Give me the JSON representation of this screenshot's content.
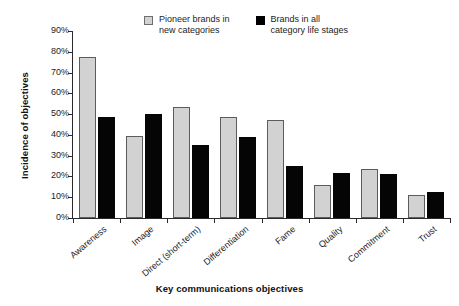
{
  "chart_data": {
    "type": "bar",
    "title": "",
    "xlabel": "Key communications objectives",
    "ylabel": "Incidence of objectives",
    "ylim": [
      0,
      90
    ],
    "ytick_labels": [
      "0%",
      "10%",
      "20%",
      "30%",
      "40%",
      "50%",
      "60%",
      "70%",
      "80%",
      "90%"
    ],
    "ytick_values": [
      0,
      10,
      20,
      30,
      40,
      50,
      60,
      70,
      80,
      90
    ],
    "grid": false,
    "legend_position": "top-center",
    "categories": [
      "Awareness",
      "Image",
      "Direct (short-term)",
      "Differentiation",
      "Fame",
      "Quality",
      "Commitment",
      "Trust"
    ],
    "series": [
      {
        "name": "Pioneer brands in\nnew categories",
        "color": "#d2d2d2",
        "values": [
          77.5,
          39.5,
          53.5,
          48.5,
          47,
          16,
          23.5,
          11
        ]
      },
      {
        "name": "Brands in all\ncategory life stages",
        "color": "#000000",
        "values": [
          48.5,
          50,
          35,
          39,
          25,
          21.5,
          21,
          12.5
        ]
      }
    ]
  },
  "legend": {
    "entries": [
      {
        "label": "Pioneer brands in\nnew categories",
        "swatch": "gray-square-swatch"
      },
      {
        "label": "Brands in all\ncategory life stages",
        "swatch": "black-square-swatch"
      }
    ]
  }
}
